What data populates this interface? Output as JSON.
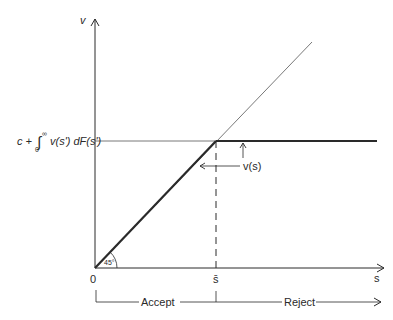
{
  "diagram": {
    "axes": {
      "y_label": "v",
      "x_label": "s",
      "origin_label": "0",
      "threshold_label": "s̄"
    },
    "reservation_value_label": {
      "prefix": "c + ",
      "integral": "∫",
      "upper_limit": "∞",
      "lower_limit": "0",
      "integrand": "v(s') dF(s')"
    },
    "curve_label": "v(s)",
    "angle_label": "45°",
    "regions": {
      "accept": "Accept",
      "reject": "Reject"
    },
    "colors": {
      "line": "#2a2a2a",
      "thin_line": "#555555",
      "background": "#ffffff"
    }
  }
}
